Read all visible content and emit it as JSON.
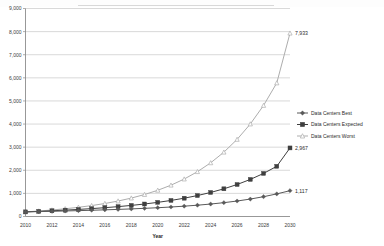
{
  "chart_data": {
    "type": "line",
    "title": "",
    "xlabel": "Year",
    "ylabel": "",
    "xlim": [
      2010,
      2030
    ],
    "ylim": [
      0,
      9000
    ],
    "grid": true,
    "legend_position": "right",
    "x": [
      2010,
      2011,
      2012,
      2013,
      2014,
      2015,
      2016,
      2017,
      2018,
      2019,
      2020,
      2021,
      2022,
      2023,
      2024,
      2025,
      2026,
      2027,
      2028,
      2029,
      2030
    ],
    "xtick_labels": [
      "2010",
      "2012",
      "2014",
      "2016",
      "2018",
      "2020",
      "2022",
      "2024",
      "2026",
      "2028",
      "2030"
    ],
    "ytick_labels": [
      "0",
      "1,000",
      "2,000",
      "3,000",
      "4,000",
      "5,000",
      "6,000",
      "7,000",
      "8,000",
      "9,000"
    ],
    "ytick_values": [
      0,
      1000,
      2000,
      3000,
      4000,
      5000,
      6000,
      7000,
      8000,
      9000
    ],
    "series": [
      {
        "name": "Data Centers Best",
        "marker": "diamond",
        "color": "#595959",
        "end_label": "1,117",
        "values": [
          200,
          212,
          225,
          239,
          254,
          270,
          288,
          307,
          329,
          353,
          380,
          411,
          447,
          489,
          539,
          599,
          670,
          755,
          857,
          978,
          1117
        ]
      },
      {
        "name": "Data Centers Expected",
        "marker": "square",
        "color": "#3f3f3f",
        "end_label": "2,967",
        "values": [
          200,
          222,
          247,
          275,
          306,
          341,
          381,
          427,
          480,
          541,
          612,
          695,
          792,
          906,
          1040,
          1198,
          1384,
          1604,
          1864,
          2172,
          2967
        ]
      },
      {
        "name": "Data Centers Worst",
        "marker": "triangle",
        "color": "#adadad",
        "end_label": "7,933",
        "values": [
          200,
          237,
          281,
          334,
          397,
          472,
          562,
          669,
          797,
          950,
          1134,
          1355,
          1620,
          1939,
          2322,
          2783,
          3336,
          4002,
          4805,
          5778,
          7933
        ]
      }
    ]
  },
  "colors": {
    "grid": "#c9c9c9",
    "axis": "#8c8c8c",
    "text": "#2b2b2b",
    "background": "#ffffff"
  }
}
